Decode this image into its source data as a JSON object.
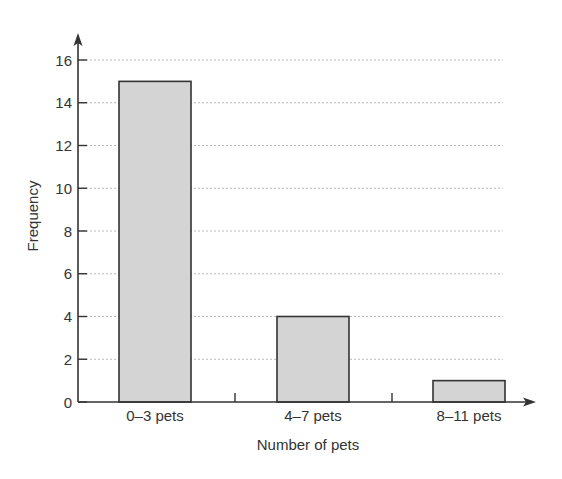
{
  "chart_data": {
    "type": "bar",
    "title": "",
    "xlabel": "Number of pets",
    "ylabel": "Frequency",
    "categories": [
      "0–3 pets",
      "4–7 pets",
      "8–11 pets"
    ],
    "values": [
      15,
      4,
      1
    ],
    "ylim": [
      0,
      16
    ],
    "yticks": [
      0,
      2,
      4,
      6,
      8,
      10,
      12,
      14,
      16
    ],
    "grid": true,
    "grid_style": "dashed horizontal",
    "legend": null,
    "colors": {
      "bar_fill": "#d4d4d4",
      "bar_stroke": "#333333",
      "axis": "#333333",
      "grid": "#b0b0b0",
      "text": "#333333"
    }
  }
}
